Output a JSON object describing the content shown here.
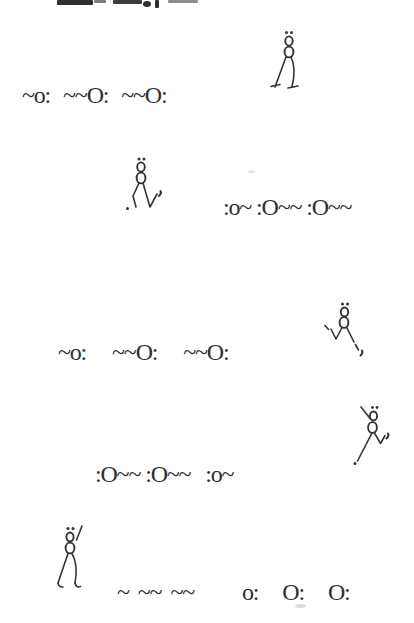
{
  "canvas": {
    "width": 414,
    "height": 623,
    "background": "#ffffff",
    "ink": "#2f2f2f"
  },
  "top_edge": {
    "name": "cropped-text-remnant"
  },
  "notation_rows": {
    "row1": {
      "items": [
        "~o:",
        "~~O:",
        "~~O:"
      ]
    },
    "row2": {
      "items": [
        ":o~",
        ":O~~",
        ":O~~"
      ]
    },
    "row3": {
      "items": [
        "~o:",
        "~~O:",
        "~~O:"
      ]
    },
    "row4": {
      "items": [
        ":O~~",
        ":O~~",
        ":o~"
      ]
    },
    "row5": {
      "items": [
        "~",
        "~~",
        "~~"
      ]
    },
    "row6": {
      "items": [
        "o:",
        "O:",
        "O:"
      ]
    }
  },
  "figures": {
    "fig1": {
      "name": "walking-oxygen-stick-figure-top-right"
    },
    "fig2": {
      "name": "dancing-oxygen-stick-figure-upper-middle"
    },
    "fig3": {
      "name": "leaping-oxygen-stick-figure-middle-right"
    },
    "fig4": {
      "name": "kicking-oxygen-stick-figure-lower-right"
    },
    "fig5": {
      "name": "strutting-oxygen-stick-figure-bottom-left"
    }
  }
}
